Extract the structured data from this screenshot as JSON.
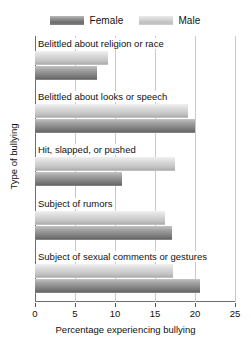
{
  "chart_data": {
    "type": "bar",
    "orientation": "horizontal",
    "title": "",
    "xlabel": "Percentage experiencing bullying",
    "ylabel": "Type of bullying",
    "xlim": [
      0,
      25
    ],
    "xticks": [
      0,
      5,
      10,
      15,
      20,
      25
    ],
    "xticklabels": [
      "0",
      "5",
      "10",
      "15",
      "20",
      "25"
    ],
    "grid": true,
    "legend_position": "top-center",
    "categories": [
      "Belittled about religion or race",
      "Belittled about looks or speech",
      "Hit, slapped, or pushed",
      "Subject of rumors",
      "Subject of sexual comments or gestures"
    ],
    "series": [
      {
        "name": "Male",
        "color": "#cfcfcf",
        "values": [
          9.1,
          19.1,
          17.5,
          16.3,
          17.3
        ]
      },
      {
        "name": "Female",
        "color": "#8a8a8a",
        "values": [
          7.8,
          20.0,
          10.9,
          17.1,
          20.6
        ]
      }
    ]
  },
  "legend": {
    "items": [
      {
        "label": "Female",
        "swatch": "female-swatch"
      },
      {
        "label": "Male",
        "swatch": "male-swatch"
      }
    ]
  },
  "axes": {
    "x_title": "Percentage experiencing bullying",
    "y_title": "Type of bullying"
  }
}
